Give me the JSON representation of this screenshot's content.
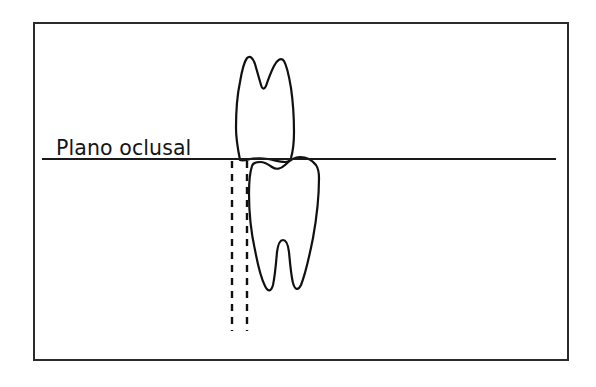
{
  "figure": {
    "background_color": "#ffffff",
    "border_color": "#2b2b2b",
    "line_color": "#101010",
    "label": {
      "text": "Plano oclusal",
      "x": 56,
      "y": 155
    },
    "frame": {
      "x": 34,
      "y": 23,
      "width": 534,
      "height": 337
    },
    "occlusal_plane": {
      "name": "occlusal-plane-line",
      "x1": 42,
      "x2": 556,
      "y": 159
    },
    "guide_lines": [
      {
        "name": "guide-line-mesial",
        "x": 232,
        "y1": 161,
        "y2": 331
      },
      {
        "name": "guide-line-distal",
        "x": 247,
        "y1": 161,
        "y2": 331
      }
    ],
    "teeth": [
      {
        "name": "upper-tooth",
        "description": "maxillary molar shown with roots upward above occlusal plane",
        "path": "M 240 160 C 238 150 236 140 236 128 C 236 112 237 96 240 82 C 242 70 244 62 247 58 C 250 55 253 58 255 64 C 257 71 259 78 261 85 C 262 89 264 90 266 86 C 268 80 271 72 274 66 C 277 60 281 57 284 61 C 287 66 289 76 291 88 C 293 102 294 118 294 132 C 294 142 293 151 291 158 C 290 161 288 162 285 162 C 280 162 274 160 268 159 C 262 158 256 158 250 159 C 246 160 243 161 240 160 Z"
      },
      {
        "name": "lower-tooth",
        "description": "mandibular molar with two roots pointing downward below occlusal plane",
        "path": "M 252 166 C 250 172 249 182 249 194 C 249 212 251 232 255 250 C 258 266 261 278 265 286 C 268 292 271 292 273 285 C 275 276 276 264 277 252 C 278 244 280 240 283 240 C 286 240 288 244 289 252 C 290 263 291 275 293 283 C 295 290 298 291 301 285 C 305 275 309 258 313 238 C 317 216 319 194 319 178 C 319 172 318 168 316 165 C 312 160 306 157 300 157 C 294 157 289 161 285 165 C 281 169 276 170 272 167 C 268 164 264 162 260 162 C 256 162 253 163 252 166 Z"
      }
    ]
  }
}
